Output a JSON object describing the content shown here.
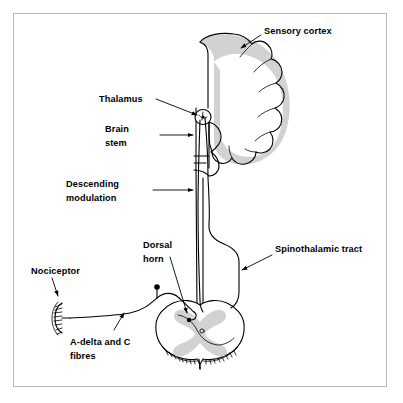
{
  "figure": {
    "background_color": "#ffffff",
    "frame_color": "#b9b9b9",
    "line_color": "#000000",
    "gray_matter_color": "#d2d2d2"
  },
  "labels": {
    "sensory_cortex": "Sensory cortex",
    "thalamus": "Thalamus",
    "brain_stem_line1": "Brain",
    "brain_stem_line2": "stem",
    "descending_line1": "Descending",
    "descending_line2": "modulation",
    "dorsal_horn_line1": "Dorsal",
    "dorsal_horn_line2": "horn",
    "spinothalamic_tract": "Spinothalamic tract",
    "nociceptor": "Nociceptor",
    "fibres_line1": "A-delta and C",
    "fibres_line2": "fibres"
  },
  "structures": {
    "cerebral_hemisphere": "cerebral-hemisphere",
    "thalamus_nucleus": "thalamus-nucleus",
    "brainstem": "brainstem",
    "spinal_cord": "spinal-cord-cross-section",
    "gray_matter": "butterfly-gray-matter",
    "dorsal_root_ganglion": "dorsal-root-ganglion",
    "free_nerve_ending": "free-nerve-ending",
    "ascending_tract": "spinothalamic-ascending-tract",
    "descending_tract": "descending-modulatory-tract",
    "peripheral_fibre": "peripheral-afferent-fibre"
  }
}
